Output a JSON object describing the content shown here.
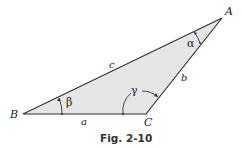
{
  "figure": {
    "caption": "Fig. 2-10",
    "fill_color": "#e6e6e6",
    "stroke_color": "#333333",
    "vertices": {
      "A": {
        "label": "A"
      },
      "B": {
        "label": "B"
      },
      "C": {
        "label": "C"
      }
    },
    "sides": {
      "a": {
        "label": "a"
      },
      "b": {
        "label": "b"
      },
      "c": {
        "label": "c"
      }
    },
    "angles": {
      "alpha": {
        "label": "α"
      },
      "beta": {
        "label": "β"
      },
      "gamma": {
        "label": "γ"
      }
    }
  }
}
